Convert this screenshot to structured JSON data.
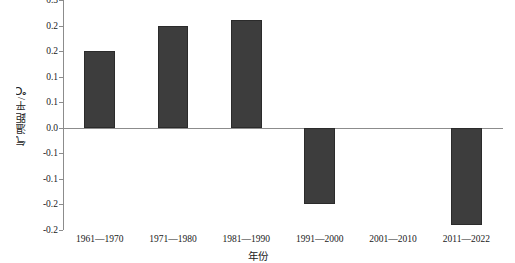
{
  "chart_data": {
    "type": "bar",
    "title": "",
    "xlabel": "年份",
    "ylabel": "气温距平/℃",
    "categories": [
      "1961—1970",
      "1971—1980",
      "1981—1990",
      "1991—2000",
      "2001—2010",
      "2011—2022"
    ],
    "values": [
      0.15,
      0.2,
      0.21,
      -0.15,
      0.0,
      -0.19
    ],
    "ylim": [
      -0.2,
      0.25
    ],
    "ytick_values": [
      0.25,
      0.2,
      0.15,
      0.1,
      0.05,
      0.0,
      -0.05,
      -0.1,
      -0.15,
      -0.2
    ],
    "ytick_labels": [
      "0.3",
      "0.2",
      "0.2",
      "0.1",
      "0.1",
      "0.0",
      "-0.1",
      "-0.1",
      "-0.2",
      "-0.2"
    ],
    "grid": false,
    "legend": null,
    "bar_color": "#3d3d3d",
    "axis_color": "#8c8c8c",
    "zero_line": 0.0
  }
}
